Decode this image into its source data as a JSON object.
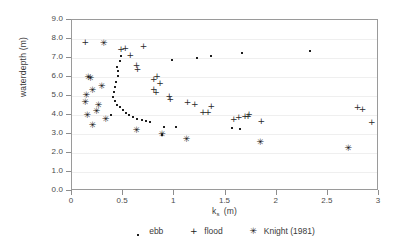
{
  "chart_data": {
    "type": "scatter",
    "title": "",
    "xlabel": "k_s (m)",
    "ylabel": "waterdepth (m)",
    "xlim": [
      0,
      3
    ],
    "ylim": [
      0,
      9
    ],
    "xticks": [
      "0",
      "0.5",
      "1",
      "1.5",
      "2",
      "2.5",
      "3"
    ],
    "xtick_values": [
      0,
      0.5,
      1,
      1.5,
      2,
      2.5,
      3
    ],
    "yticks": [
      "0.0",
      "1.0",
      "2.0",
      "3.0",
      "4.0",
      "5.0",
      "6.0",
      "7.0",
      "8.0",
      "9.0"
    ],
    "ytick_values": [
      0,
      1,
      2,
      3,
      4,
      5,
      6,
      7,
      8,
      9
    ],
    "grid": "horizontal",
    "legend_position": "below",
    "series": [
      {
        "name": "ebb",
        "marker": "dot",
        "points": [
          [
            0.44,
            6.55
          ],
          [
            0.45,
            6.3
          ],
          [
            0.45,
            6.05
          ],
          [
            0.43,
            5.75
          ],
          [
            0.42,
            5.45
          ],
          [
            0.41,
            5.2
          ],
          [
            0.4,
            4.95
          ],
          [
            0.42,
            4.72
          ],
          [
            0.44,
            4.55
          ],
          [
            0.47,
            4.4
          ],
          [
            0.5,
            4.25
          ],
          [
            0.53,
            4.12
          ],
          [
            0.56,
            4.0
          ],
          [
            0.6,
            3.9
          ],
          [
            0.64,
            3.8
          ],
          [
            0.68,
            3.72
          ],
          [
            0.72,
            3.66
          ],
          [
            0.76,
            3.62
          ],
          [
            0.47,
            6.85
          ],
          [
            0.48,
            7.1
          ],
          [
            0.9,
            3.38
          ],
          [
            1.02,
            3.35
          ],
          [
            1.56,
            3.31
          ],
          [
            1.66,
            7.25
          ],
          [
            1.36,
            7.1
          ],
          [
            1.22,
            7.02
          ],
          [
            0.98,
            6.9
          ],
          [
            2.33,
            7.35
          ],
          [
            1.64,
            3.28
          ],
          [
            0.88,
            2.95
          ],
          [
            0.38,
            3.98
          ]
        ]
      },
      {
        "name": "flood",
        "marker": "plus",
        "points": [
          [
            0.48,
            7.42
          ],
          [
            0.52,
            7.45
          ],
          [
            0.57,
            7.12
          ],
          [
            0.7,
            7.6
          ],
          [
            0.63,
            6.58
          ],
          [
            0.64,
            6.38
          ],
          [
            0.83,
            6.02
          ],
          [
            0.8,
            5.85
          ],
          [
            0.86,
            5.62
          ],
          [
            0.8,
            5.32
          ],
          [
            0.82,
            5.18
          ],
          [
            0.95,
            4.95
          ],
          [
            0.96,
            4.78
          ],
          [
            1.13,
            4.62
          ],
          [
            1.2,
            4.52
          ],
          [
            1.36,
            4.4
          ],
          [
            1.28,
            4.08
          ],
          [
            1.33,
            4.12
          ],
          [
            1.58,
            3.72
          ],
          [
            1.63,
            3.85
          ],
          [
            1.69,
            3.92
          ],
          [
            1.73,
            4.02
          ],
          [
            1.72,
            3.88
          ],
          [
            1.85,
            3.62
          ],
          [
            2.79,
            4.38
          ],
          [
            2.84,
            4.28
          ],
          [
            2.93,
            3.58
          ],
          [
            0.13,
            7.78
          ]
        ]
      },
      {
        "name": "Knight (1981)",
        "marker": "star",
        "points": [
          [
            0.31,
            7.75
          ],
          [
            0.16,
            5.95
          ],
          [
            0.18,
            5.88
          ],
          [
            0.2,
            5.25
          ],
          [
            0.29,
            5.45
          ],
          [
            0.14,
            5.02
          ],
          [
            0.13,
            4.62
          ],
          [
            0.15,
            3.94
          ],
          [
            0.24,
            4.15
          ],
          [
            0.26,
            4.45
          ],
          [
            0.2,
            3.4
          ],
          [
            0.33,
            3.72
          ],
          [
            0.63,
            3.16
          ],
          [
            0.88,
            2.96
          ],
          [
            1.12,
            2.7
          ],
          [
            1.84,
            2.52
          ],
          [
            2.7,
            2.22
          ]
        ]
      }
    ]
  },
  "legend": {
    "items": [
      {
        "label": "ebb",
        "key": "·"
      },
      {
        "label": "flood",
        "key": "+"
      },
      {
        "label": "Knight (1981)",
        "key": "✳"
      }
    ]
  },
  "axes": {
    "x_title_main": "k",
    "x_title_sub": "s",
    "x_title_unit": "(m)",
    "y_title": "waterdepth (m)"
  }
}
